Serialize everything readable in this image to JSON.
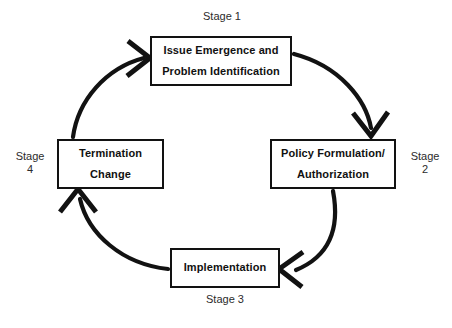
{
  "diagram": {
    "background_color": "#ffffff",
    "stroke_color": "#121212",
    "boxes": [
      {
        "id": "issue",
        "line1": "Issue Emergence and",
        "line2": "Problem Identification"
      },
      {
        "id": "policy",
        "line1": "Policy Formulation/",
        "line2": "Authorization"
      },
      {
        "id": "implementation",
        "line1": "Implementation",
        "line2": ""
      },
      {
        "id": "termination",
        "line1": "Termination",
        "line2": "Change"
      }
    ],
    "stage_labels": [
      {
        "id": "stage1",
        "text": "Stage 1",
        "position": "above-issue-box"
      },
      {
        "id": "stage2",
        "text": "Stage\n2",
        "position": "right-of-policy-box"
      },
      {
        "id": "stage3",
        "text": "Stage 3",
        "position": "below-implementation-box"
      },
      {
        "id": "stage4",
        "text": "Stage\n4",
        "position": "left-of-termination-box"
      }
    ],
    "arrows": [
      {
        "id": "arrow-issue-to-policy",
        "from": "issue",
        "to": "policy",
        "direction": "clockwise-top-right"
      },
      {
        "id": "arrow-policy-to-implementation",
        "from": "policy",
        "to": "implementation",
        "direction": "clockwise-bottom-right"
      },
      {
        "id": "arrow-implementation-to-termination",
        "from": "implementation",
        "to": "termination",
        "direction": "clockwise-bottom-left"
      },
      {
        "id": "arrow-termination-to-issue",
        "from": "termination",
        "to": "issue",
        "direction": "clockwise-top-left"
      }
    ]
  }
}
